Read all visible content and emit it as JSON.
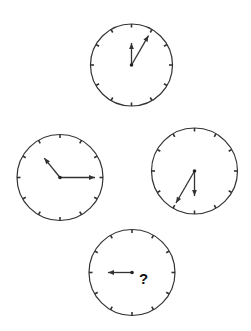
{
  "puzzle": {
    "type": "clock-sequence",
    "clocks": [
      {
        "id": "top",
        "hands": [
          {
            "kind": "hour",
            "clock_position": 12
          },
          {
            "kind": "minute",
            "clock_position": 1
          }
        ]
      },
      {
        "id": "left",
        "hands": [
          {
            "kind": "hour",
            "clock_position": 10.7
          },
          {
            "kind": "minute",
            "clock_position": 3
          }
        ]
      },
      {
        "id": "right",
        "hands": [
          {
            "kind": "hour",
            "clock_position": 6
          },
          {
            "kind": "minute",
            "clock_position": 7
          }
        ]
      },
      {
        "id": "bottom",
        "hands": [
          {
            "kind": "hour",
            "clock_position": 9
          }
        ],
        "unknown_label": "?"
      }
    ],
    "ticks_per_face": 12,
    "colors": {
      "ink": "#333333",
      "background": "#ffffff"
    }
  }
}
